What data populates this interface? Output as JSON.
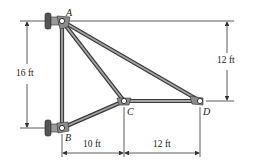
{
  "diagram": {
    "type": "truss",
    "nodes": [
      {
        "id": "A",
        "label": "A",
        "x": 62,
        "y": 21,
        "support": "wall-pin"
      },
      {
        "id": "B",
        "label": "B",
        "x": 62,
        "y": 128,
        "support": "wall-pin"
      },
      {
        "id": "C",
        "label": "C",
        "x": 124,
        "y": 101
      },
      {
        "id": "D",
        "label": "D",
        "x": 200,
        "y": 101
      }
    ],
    "members": [
      {
        "from": "A",
        "to": "B"
      },
      {
        "from": "A",
        "to": "C"
      },
      {
        "from": "A",
        "to": "D"
      },
      {
        "from": "B",
        "to": "C"
      },
      {
        "from": "C",
        "to": "D"
      }
    ],
    "dimensions": {
      "left_height": "16 ft",
      "right_height": "12 ft",
      "bottom_bc": "10 ft",
      "bottom_cd": "12 ft"
    },
    "colors": {
      "member_fill": "#8a8a8a",
      "member_edge": "#3a3a3a",
      "line": "#333333",
      "background": "#ffffff"
    }
  }
}
